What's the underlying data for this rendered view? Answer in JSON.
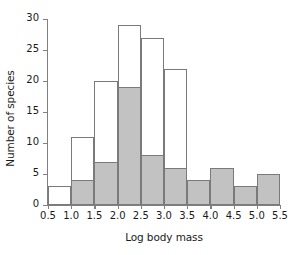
{
  "chart_data": {
    "type": "bar",
    "title": "",
    "xlabel": "Log body mass",
    "ylabel": "Number of species",
    "xlim": [
      0.5,
      5.5
    ],
    "ylim": [
      0,
      30
    ],
    "grid": false,
    "legend": "none",
    "bin_width": 0.5,
    "bin_edges": [
      0.5,
      1.0,
      1.5,
      2.0,
      2.5,
      3.0,
      3.5,
      4.0,
      4.5,
      5.0,
      5.5
    ],
    "categories": [
      "0.5-1.0",
      "1.0-1.5",
      "1.5-2.0",
      "2.0-2.5",
      "2.5-3.0",
      "3.0-3.5",
      "3.5-4.0",
      "4.0-4.5",
      "4.5-5.0",
      "5.0-5.5"
    ],
    "series": [
      {
        "name": "All species (open outline)",
        "fill_color": "#ffffff",
        "edge_color": "#7a7a7a",
        "values": [
          3,
          11,
          20,
          29,
          27,
          22,
          4,
          6,
          3,
          5
        ]
      },
      {
        "name": "Subset (shaded)",
        "fill_color": "#c2c2c2",
        "edge_color": "#7a7a7a",
        "values": [
          0,
          4,
          7,
          19,
          8,
          6,
          4,
          6,
          3,
          5
        ]
      }
    ],
    "x_ticks": [
      0.5,
      1.0,
      1.5,
      2.0,
      2.5,
      3.0,
      3.5,
      4.0,
      4.5,
      5.0,
      5.5
    ],
    "x_tick_labels": [
      "0.5",
      "1.0",
      "1.5",
      "2.0",
      "2.5",
      "3.0",
      "3.5",
      "4.0",
      "4.5",
      "5.0",
      "5.5"
    ],
    "y_ticks": [
      0,
      5,
      10,
      15,
      20,
      25,
      30
    ],
    "y_tick_labels": [
      "0",
      "5",
      "10",
      "15",
      "20",
      "25",
      "30"
    ]
  }
}
